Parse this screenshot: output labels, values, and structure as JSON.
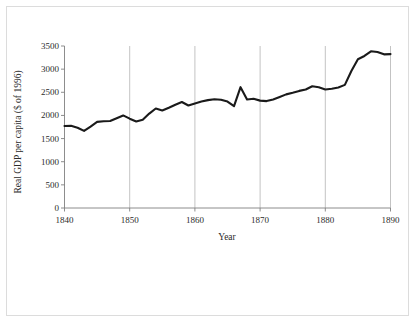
{
  "chart_data": {
    "type": "line",
    "title": "",
    "xlabel": "Year",
    "ylabel": "Real GDP per capita ($ of 1996)",
    "xlim": [
      1840,
      1890
    ],
    "ylim": [
      0,
      3500
    ],
    "grid": "vertical",
    "legend": "none",
    "line_color": "#1a1a1a",
    "axis_color": "#808080",
    "grid_color": "#b4b4b4",
    "background": "#ffffff",
    "xticks": [
      1840,
      1850,
      1860,
      1870,
      1880,
      1890
    ],
    "xtick_labels": [
      "1840",
      "1850",
      "1860",
      "1870",
      "1880",
      "1890"
    ],
    "yticks": [
      0,
      500,
      1000,
      1500,
      2000,
      2500,
      3000,
      3500
    ],
    "ytick_labels": [
      "0",
      "500",
      "1000",
      "1500",
      "2000",
      "2500",
      "3000",
      "3500"
    ],
    "x": [
      1840,
      1841,
      1842,
      1843,
      1844,
      1845,
      1846,
      1847,
      1848,
      1849,
      1850,
      1851,
      1852,
      1853,
      1854,
      1855,
      1856,
      1857,
      1858,
      1859,
      1860,
      1861,
      1862,
      1863,
      1864,
      1865,
      1866,
      1867,
      1868,
      1869,
      1870,
      1871,
      1872,
      1873,
      1874,
      1875,
      1876,
      1877,
      1878,
      1879,
      1880,
      1881,
      1882,
      1883,
      1884,
      1885,
      1886,
      1887,
      1888,
      1889,
      1890
    ],
    "values": [
      1770,
      1775,
      1735,
      1665,
      1760,
      1860,
      1875,
      1880,
      1940,
      2000,
      1930,
      1870,
      1905,
      2040,
      2150,
      2105,
      2165,
      2230,
      2290,
      2215,
      2260,
      2300,
      2330,
      2350,
      2340,
      2300,
      2200,
      2610,
      2345,
      2360,
      2320,
      2310,
      2345,
      2400,
      2455,
      2490,
      2530,
      2560,
      2630,
      2610,
      2560,
      2575,
      2605,
      2660,
      2960,
      3215,
      3285,
      3385,
      3370,
      3320,
      3325
    ],
    "series": [
      {
        "name": "Real GDP per capita",
        "values": [
          1770,
          1775,
          1735,
          1665,
          1760,
          1860,
          1875,
          1880,
          1940,
          2000,
          1930,
          1870,
          1905,
          2040,
          2150,
          2105,
          2165,
          2230,
          2290,
          2215,
          2260,
          2300,
          2330,
          2350,
          2340,
          2300,
          2200,
          2610,
          2345,
          2360,
          2320,
          2310,
          2345,
          2400,
          2455,
          2490,
          2530,
          2560,
          2630,
          2610,
          2560,
          2575,
          2605,
          2660,
          2960,
          3215,
          3285,
          3385,
          3370,
          3320,
          3325
        ]
      }
    ]
  }
}
